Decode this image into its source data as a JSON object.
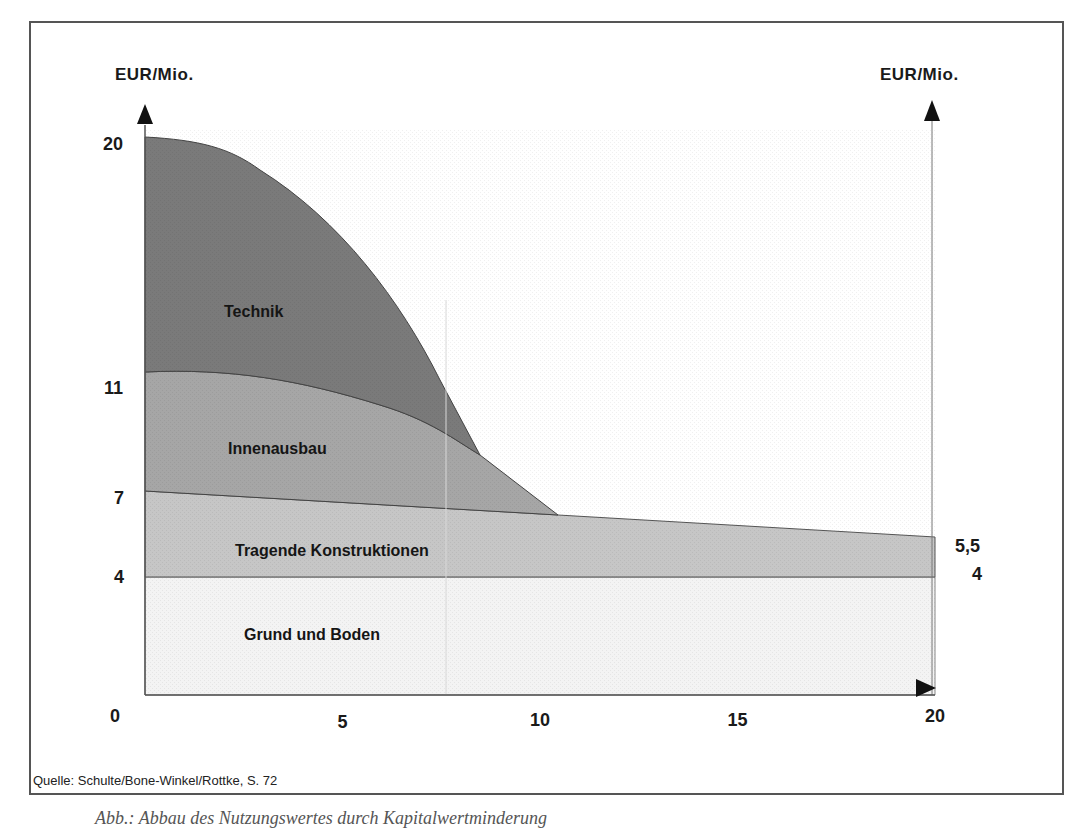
{
  "chart_data": {
    "type": "area",
    "title": "",
    "xlabel": "",
    "ylabel": "EUR/Mio.",
    "ylabel_right": "EUR/Mio.",
    "x_ticks": [
      "0",
      "5",
      "10",
      "15",
      "20"
    ],
    "y_ticks_left": [
      "20",
      "11",
      "7",
      "4"
    ],
    "y_ticks_right": [
      "5,5",
      "4"
    ],
    "xlim": [
      0,
      20
    ],
    "ylim": [
      0,
      20
    ],
    "stacked": true,
    "x": [
      0,
      2,
      4,
      6,
      8,
      10,
      12,
      14,
      16,
      18,
      20
    ],
    "series": [
      {
        "name": "Grund und Boden",
        "cumulative_top": [
          4,
          4,
          4,
          4,
          4,
          4,
          4,
          4,
          4,
          4,
          4
        ],
        "color": "#f2f2f2"
      },
      {
        "name": "Tragende Konstruktionen",
        "cumulative_top": [
          7.1,
          6.9,
          6.7,
          6.5,
          6.3,
          6.1,
          6.0,
          5.9,
          5.8,
          5.6,
          5.5
        ],
        "color": "#c4c4c4"
      },
      {
        "name": "Innenausbau",
        "cumulative_top": [
          11.4,
          11.3,
          10.8,
          9.9,
          8.8,
          6.1,
          6.0,
          5.9,
          5.8,
          5.6,
          5.5
        ],
        "color": "#a3a3a3"
      },
      {
        "name": "Technik",
        "cumulative_top": [
          20,
          19.6,
          17.6,
          14.0,
          8.8,
          6.1,
          6.0,
          5.9,
          5.8,
          5.6,
          5.5
        ],
        "color": "#777777"
      }
    ],
    "grid": false,
    "legend": "inline labels",
    "source": "Quelle: Schulte/Bone-Winkel/Rottke, S. 72"
  },
  "labels": {
    "y_axis_left": "EUR/Mio.",
    "y_axis_right": "EUR/Mio.",
    "technik": "Technik",
    "innenausbau": "Innenausbau",
    "tragende": "Tragende Konstruktionen",
    "grund": "Grund und Boden",
    "y20": "20",
    "y11": "11",
    "y7": "7",
    "y4": "4",
    "yr55": "5,5",
    "yr4": "4",
    "x0": "0",
    "x5": "5",
    "x10": "10",
    "x15": "15",
    "x20": "20",
    "source": "Quelle: Schulte/Bone-Winkel/Rottke, S. 72",
    "caption": "Abb.: Abbau des Nutzungswertes durch Kapitalwertminderung"
  }
}
